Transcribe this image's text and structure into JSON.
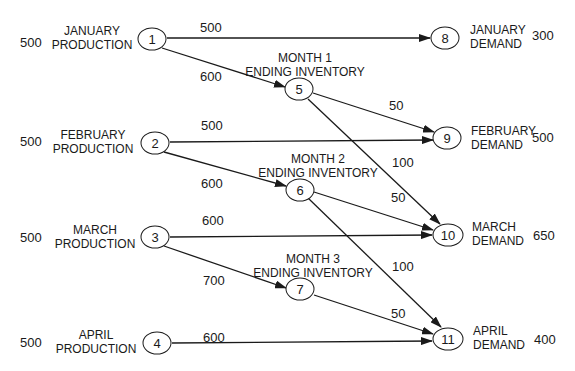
{
  "supply_nodes": [
    {
      "id": "1",
      "line1": "JANUARY",
      "line2": "PRODUCTION",
      "supply": "500"
    },
    {
      "id": "2",
      "line1": "FEBRUARY",
      "line2": "PRODUCTION",
      "supply": "500"
    },
    {
      "id": "3",
      "line1": "MARCH",
      "line2": "PRODUCTION",
      "supply": "500"
    },
    {
      "id": "4",
      "line1": "APRIL",
      "line2": "PRODUCTION",
      "supply": "500"
    }
  ],
  "inventory_nodes": [
    {
      "id": "5",
      "line1": "MONTH 1",
      "line2": "ENDING INVENTORY"
    },
    {
      "id": "6",
      "line1": "MONTH 2",
      "line2": "ENDING INVENTORY"
    },
    {
      "id": "7",
      "line1": "MONTH 3",
      "line2": "ENDING INVENTORY"
    }
  ],
  "demand_nodes": [
    {
      "id": "8",
      "line1": "JANUARY",
      "line2": "DEMAND",
      "demand": "300"
    },
    {
      "id": "9",
      "line1": "FEBRUARY",
      "line2": "DEMAND",
      "demand": "500"
    },
    {
      "id": "10",
      "line1": "MARCH",
      "line2": "DEMAND",
      "demand": "650"
    },
    {
      "id": "11",
      "line1": "APRIL",
      "line2": "DEMAND",
      "demand": "400"
    }
  ],
  "arcs": [
    {
      "from": "1",
      "to": "8",
      "label": "500"
    },
    {
      "from": "1",
      "to": "5",
      "label": "600"
    },
    {
      "from": "5",
      "to": "9",
      "label": "50"
    },
    {
      "from": "5",
      "to": "10",
      "label": "100"
    },
    {
      "from": "2",
      "to": "9",
      "label": "500"
    },
    {
      "from": "2",
      "to": "6",
      "label": "600"
    },
    {
      "from": "6",
      "to": "10",
      "label": "50"
    },
    {
      "from": "6",
      "to": "11",
      "label": "100"
    },
    {
      "from": "3",
      "to": "10",
      "label": "600"
    },
    {
      "from": "3",
      "to": "7",
      "label": "700"
    },
    {
      "from": "7",
      "to": "11",
      "label": "50"
    },
    {
      "from": "4",
      "to": "11",
      "label": "600"
    }
  ]
}
